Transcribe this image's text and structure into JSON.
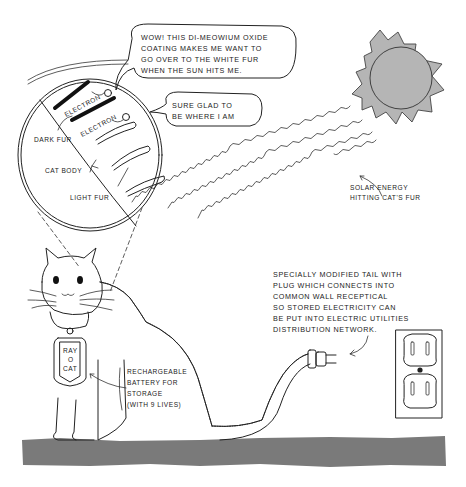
{
  "bubbles": {
    "top": [
      "WOW! THIS DI-MEOWIUM OXIDE",
      "COATING MAKES ME  WANT TO",
      "GO OVER  TO THE  WHITE FUR",
      "WHEN  THE  SUN  HITS ME."
    ],
    "second": [
      "SURE  GLAD TO",
      "BE  WHERE  I  AM"
    ]
  },
  "magnified": {
    "electron_1": "ELECTRON",
    "electron_2": "ELECTRON",
    "dark_fur": "DARK  FUR",
    "cat_body": "CAT  BODY",
    "light_fur": "LIGHT  FUR"
  },
  "labels": {
    "solar": [
      "SOLAR  ENERGY",
      "HITTING  CAT'S  FUR"
    ],
    "tail": [
      "SPECIALLY  MODIFIED  TAIL  WITH",
      "PLUG  WHICH  CONNECTS  INTO",
      "COMMON  WALL  RECEPTICAL",
      "SO  STORED  ELECTRICITY  CAN",
      "BE  PUT  INTO  ELECTRIC  UTILITIES",
      "DISTRIBUTION  NETWORK."
    ],
    "battery": [
      "RECHARGEABLE",
      "BATTERY  FOR",
      "STORAGE",
      "(WITH  9  LIVES)"
    ]
  },
  "tag": {
    "line1": "RAY",
    "line2": "O",
    "line3": "CAT"
  },
  "colors": {
    "sun": "#b5b5b5",
    "ground": "#7a7a7a",
    "ink": "#222222"
  }
}
